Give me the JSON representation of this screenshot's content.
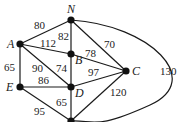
{
  "graph": {
    "nodes": [
      {
        "id": "N",
        "label": "N",
        "x": 71,
        "y": 20,
        "lx": 67,
        "ly": 13
      },
      {
        "id": "A",
        "label": "A",
        "x": 20,
        "y": 44,
        "lx": 7,
        "ly": 48
      },
      {
        "id": "B",
        "label": "B",
        "x": 71,
        "y": 54,
        "lx": 75,
        "ly": 64
      },
      {
        "id": "C",
        "label": "C",
        "x": 126,
        "y": 71,
        "lx": 132,
        "ly": 75
      },
      {
        "id": "E",
        "label": "E",
        "x": 20,
        "y": 87,
        "lx": 6,
        "ly": 91
      },
      {
        "id": "D",
        "label": "D",
        "x": 71,
        "y": 87,
        "lx": 75,
        "ly": 97
      },
      {
        "id": "F",
        "label": "",
        "x": 71,
        "y": 121,
        "lx": 0,
        "ly": 0
      }
    ],
    "edges": [
      {
        "from": "A",
        "to": "N",
        "weight": "80",
        "lx": 34,
        "ly": 29
      },
      {
        "from": "A",
        "to": "B",
        "weight": "112",
        "lx": 40,
        "ly": 47
      },
      {
        "from": "N",
        "to": "B",
        "weight": "82",
        "lx": 58,
        "ly": 40
      },
      {
        "from": "N",
        "to": "C",
        "weight": "70",
        "lx": 104,
        "ly": 48
      },
      {
        "from": "N",
        "to": "F",
        "weight": "130",
        "lx": 160,
        "ly": 75,
        "curve": true
      },
      {
        "from": "A",
        "to": "E",
        "weight": "65",
        "lx": 4,
        "ly": 71
      },
      {
        "from": "A",
        "to": "D",
        "weight": "90",
        "lx": 32,
        "ly": 72
      },
      {
        "from": "B",
        "to": "D",
        "weight": "74",
        "lx": 56,
        "ly": 72
      },
      {
        "from": "B",
        "to": "C",
        "weight": "78",
        "lx": 85,
        "ly": 57
      },
      {
        "from": "D",
        "to": "C",
        "weight": "97",
        "lx": 88,
        "ly": 76
      },
      {
        "from": "E",
        "to": "D",
        "weight": "86",
        "lx": 38,
        "ly": 84
      },
      {
        "from": "E",
        "to": "F",
        "weight": "95",
        "lx": 34,
        "ly": 115
      },
      {
        "from": "D",
        "to": "F",
        "weight": "65",
        "lx": 56,
        "ly": 106
      },
      {
        "from": "F",
        "to": "C",
        "weight": "120",
        "lx": 110,
        "ly": 96
      }
    ]
  }
}
